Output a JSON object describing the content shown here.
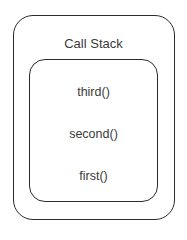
{
  "diagram": {
    "title": "Call Stack",
    "frames": [
      {
        "label": "third()"
      },
      {
        "label": "second()"
      },
      {
        "label": "first()"
      }
    ],
    "colors": {
      "border": "#2b2b2b",
      "text": "#3a3a3a",
      "background": "#ffffff"
    }
  }
}
